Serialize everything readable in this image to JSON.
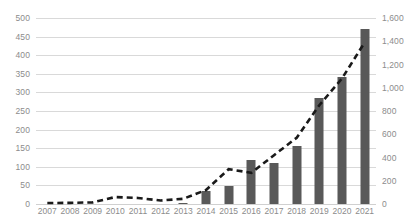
{
  "chart_data": {
    "type": "bar",
    "title": "",
    "subtitle": "",
    "xlabel": "",
    "ylabel": "",
    "grid": true,
    "legend": "none",
    "categories": [
      "2007",
      "2008",
      "2009",
      "2010",
      "2011",
      "2012",
      "2013",
      "2014",
      "2015",
      "2016",
      "2017",
      "2018",
      "2019",
      "2020",
      "2021"
    ],
    "axes": {
      "left": {
        "ylim": [
          0,
          500
        ],
        "step": 50,
        "ticks": [
          "0",
          "50",
          "100",
          "150",
          "200",
          "250",
          "300",
          "350",
          "400",
          "450",
          "500"
        ],
        "tick_values": [
          0,
          50,
          100,
          150,
          200,
          250,
          300,
          350,
          400,
          450,
          500
        ]
      },
      "right": {
        "ylim": [
          0,
          1600
        ],
        "step": 200,
        "ticks": [
          "0",
          "200",
          "400",
          "600",
          "800",
          "1,000",
          "1,200",
          "1,400",
          "1,600"
        ],
        "tick_values": [
          0,
          200,
          400,
          600,
          800,
          1000,
          1200,
          1400,
          1600
        ]
      }
    },
    "series": [
      {
        "name": "bars",
        "render": "bar",
        "axis": "left",
        "color": "#595959",
        "values": [
          0,
          0,
          0,
          0,
          0,
          0,
          3,
          34,
          48,
          119,
          110,
          155,
          284,
          341,
          471
        ]
      },
      {
        "name": "line",
        "render": "dashed-line",
        "axis": "right",
        "color": "#1a1a1a",
        "values": [
          8,
          10,
          14,
          60,
          52,
          30,
          45,
          120,
          300,
          268,
          420,
          570,
          850,
          1080,
          1390
        ]
      }
    ]
  },
  "colors": {
    "bar": "#595959",
    "line": "#1a1a1a",
    "grid": "#d9d9d9",
    "tick_text": "#8c8c8c",
    "background": "#ffffff"
  }
}
